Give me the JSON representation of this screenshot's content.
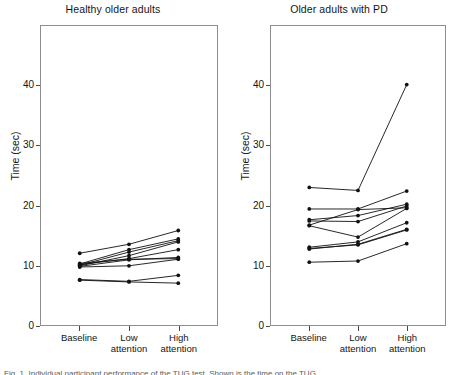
{
  "figure": {
    "width": 452,
    "height": 374,
    "background": "#ffffff",
    "line_color": "#111111",
    "frame_color": "#8d8d8d",
    "caption": "Fig. 1. Individual participant performance of the TUG test. Shown is the time on the TUG"
  },
  "axis": {
    "y_label": "Time (sec)",
    "y_ticks": [
      0,
      10,
      20,
      30,
      40
    ],
    "y_tick_labels": [
      "0",
      "10",
      "20",
      "30",
      "40"
    ],
    "y_min": 0,
    "y_max": 50,
    "x_categories": [
      "Baseline",
      "Low attention",
      "High attention"
    ],
    "x_category_lines": [
      [
        "Baseline",
        ""
      ],
      [
        "Low",
        "attention"
      ],
      [
        "High",
        "attention"
      ]
    ]
  },
  "chart_data": [
    {
      "type": "line",
      "panel": "left",
      "title": "Healthy older adults",
      "xlabel": "",
      "ylabel": "Time (sec)",
      "categories": [
        "Baseline",
        "Low attention",
        "High attention"
      ],
      "ylim": [
        0,
        50
      ],
      "yticks": [
        0,
        10,
        20,
        30,
        40
      ],
      "grid": false,
      "legend": "none",
      "markers": true,
      "n_subjects": 10,
      "series": [
        {
          "name": "P1",
          "values": [
            12.0,
            13.5,
            15.8
          ]
        },
        {
          "name": "P2",
          "values": [
            10.2,
            12.6,
            14.4
          ]
        },
        {
          "name": "P3",
          "values": [
            10.0,
            12.2,
            14.1
          ]
        },
        {
          "name": "P4",
          "values": [
            9.9,
            11.6,
            13.9
          ]
        },
        {
          "name": "P5",
          "values": [
            10.1,
            11.1,
            12.6
          ]
        },
        {
          "name": "P6",
          "values": [
            9.8,
            10.9,
            11.3
          ]
        },
        {
          "name": "P7",
          "values": [
            10.3,
            11.0,
            11.1
          ]
        },
        {
          "name": "P8",
          "values": [
            9.7,
            9.9,
            11.0
          ]
        },
        {
          "name": "P9",
          "values": [
            7.6,
            7.3,
            8.3
          ]
        },
        {
          "name": "P10",
          "values": [
            7.5,
            7.2,
            7.0
          ]
        }
      ]
    },
    {
      "type": "line",
      "panel": "right",
      "title": "Older adults with PD",
      "xlabel": "",
      "ylabel": "Time (sec)",
      "categories": [
        "Baseline",
        "Low attention",
        "High attention"
      ],
      "ylim": [
        0,
        50
      ],
      "yticks": [
        0,
        10,
        20,
        30,
        40
      ],
      "grid": false,
      "legend": "none",
      "markers": true,
      "n_subjects": 10,
      "series": [
        {
          "name": "P1",
          "values": [
            23.0,
            22.5,
            40.2
          ]
        },
        {
          "name": "P2",
          "values": [
            19.4,
            19.4,
            22.4
          ]
        },
        {
          "name": "P3",
          "values": [
            17.6,
            18.3,
            20.2
          ]
        },
        {
          "name": "P4",
          "values": [
            17.4,
            17.3,
            19.9
          ]
        },
        {
          "name": "P5",
          "values": [
            16.7,
            19.3,
            19.6
          ]
        },
        {
          "name": "P6",
          "values": [
            16.6,
            14.7,
            19.5
          ]
        },
        {
          "name": "P7",
          "values": [
            13.0,
            13.9,
            17.1
          ]
        },
        {
          "name": "P8",
          "values": [
            12.8,
            13.4,
            15.9
          ]
        },
        {
          "name": "P9",
          "values": [
            12.7,
            13.5,
            16.0
          ]
        },
        {
          "name": "P10",
          "values": [
            10.5,
            10.7,
            13.6
          ]
        }
      ]
    }
  ]
}
